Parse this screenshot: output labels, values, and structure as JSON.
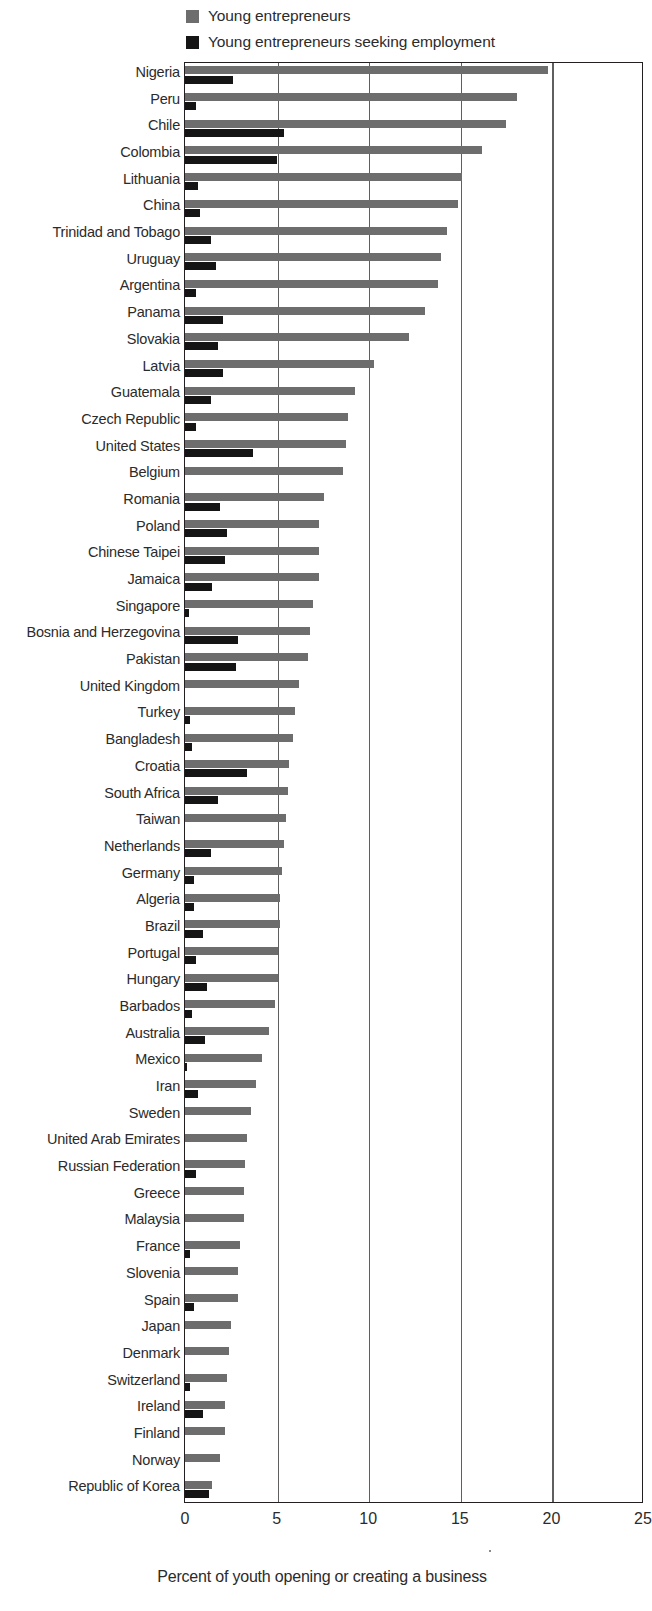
{
  "legend": {
    "position": "top-left",
    "items": [
      {
        "label": "Young entrepreneurs",
        "color": "#6d6d6d",
        "icon": "square-swatch-icon"
      },
      {
        "label": "Young entrepreneurs seeking employment",
        "color": "#151515",
        "icon": "square-swatch-icon"
      }
    ]
  },
  "axis": {
    "x_title": "Percent of youth opening or creating a business",
    "ticks": [
      "0",
      "5",
      "10",
      "15",
      "20",
      "25"
    ]
  },
  "chart_data": {
    "type": "bar",
    "orientation": "horizontal",
    "title": "",
    "subtitle": "",
    "xlabel": "Percent of youth opening or creating a business",
    "ylabel": "",
    "xlim": [
      0,
      25
    ],
    "xticks": [
      0,
      5,
      10,
      15,
      20,
      25
    ],
    "grid": "vertical",
    "legend_position": "top-left",
    "categories": [
      "Nigeria",
      "Peru",
      "Chile",
      "Colombia",
      "Lithuania",
      "China",
      "Trinidad and Tobago",
      "Uruguay",
      "Argentina",
      "Panama",
      "Slovakia",
      "Latvia",
      "Guatemala",
      "Czech Republic",
      "United States",
      "Belgium",
      "Romania",
      "Poland",
      "Chinese Taipei",
      "Jamaica",
      "Singapore",
      "Bosnia and Herzegovina",
      "Pakistan",
      "United Kingdom",
      "Turkey",
      "Bangladesh",
      "Croatia",
      "South Africa",
      "Taiwan",
      "Netherlands",
      "Germany",
      "Algeria",
      "Brazil",
      "Portugal",
      "Hungary",
      "Barbados",
      "Australia",
      "Mexico",
      "Iran",
      "Sweden",
      "United Arab Emirates",
      "Russian Federation",
      "Greece",
      "Malaysia",
      "France",
      "Slovenia",
      "Spain",
      "Japan",
      "Denmark",
      "Switzerland",
      "Ireland",
      "Finland",
      "Norway",
      "Republic of Korea"
    ],
    "series": [
      {
        "name": "Young entrepreneurs",
        "color": "#6d6d6d",
        "values": [
          19.8,
          18.1,
          17.5,
          16.2,
          15.1,
          14.9,
          14.3,
          14.0,
          13.8,
          13.1,
          12.2,
          10.3,
          9.3,
          8.9,
          8.8,
          8.6,
          7.6,
          7.3,
          7.3,
          7.3,
          7.0,
          6.8,
          6.7,
          6.2,
          6.0,
          5.9,
          5.7,
          5.6,
          5.5,
          5.4,
          5.3,
          5.2,
          5.2,
          5.1,
          5.1,
          4.9,
          4.6,
          4.2,
          3.9,
          3.6,
          3.4,
          3.3,
          3.2,
          3.2,
          3.0,
          2.9,
          2.9,
          2.5,
          2.4,
          2.3,
          2.2,
          2.2,
          1.9,
          1.5
        ]
      },
      {
        "name": "Young entrepreneurs seeking employment",
        "color": "#151515",
        "values": [
          2.6,
          0.6,
          5.4,
          5.0,
          0.7,
          0.8,
          1.4,
          1.7,
          0.6,
          2.1,
          1.8,
          2.1,
          1.4,
          0.6,
          3.7,
          0.0,
          1.9,
          2.3,
          2.2,
          1.5,
          0.2,
          2.9,
          2.8,
          0.0,
          0.3,
          0.4,
          3.4,
          1.8,
          0.0,
          1.4,
          0.5,
          0.5,
          1.0,
          0.6,
          1.2,
          0.4,
          1.1,
          0.1,
          0.7,
          0.0,
          0.0,
          0.6,
          0.0,
          0.0,
          0.3,
          0.0,
          0.5,
          0.0,
          0.0,
          0.3,
          1.0,
          0.0,
          0.0,
          1.3
        ]
      }
    ]
  }
}
